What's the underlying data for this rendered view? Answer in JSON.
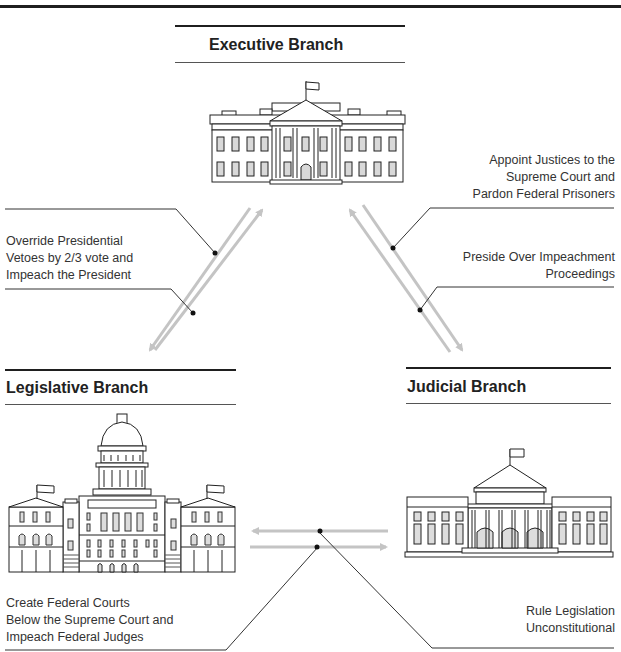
{
  "branches": {
    "executive": {
      "title": "Executive Branch",
      "building": "white-house"
    },
    "legislative": {
      "title": "Legislative Branch",
      "building": "capitol"
    },
    "judicial": {
      "title": "Judicial Branch",
      "building": "supreme-court"
    }
  },
  "checks": {
    "legislative_on_executive": [
      "Override Presidential",
      "Vetoes by 2/3 vote and",
      "Impeach the President"
    ],
    "executive_on_judicial": [
      "Appoint Justices to the",
      "Supreme Court and",
      "Pardon Federal Prisoners"
    ],
    "judicial_on_executive": [
      "Preside Over Impeachment",
      "Proceedings"
    ],
    "legislative_on_judicial": [
      "Create Federal Courts",
      "Below the Supreme Court and",
      "Impeach Federal Judges"
    ],
    "judicial_on_legislative": [
      "Rule Legislation",
      "Unconstitutional"
    ]
  },
  "colors": {
    "arrow": "#c4c4c4",
    "ink": "#222222",
    "window_fill": "#d9d9d9"
  }
}
